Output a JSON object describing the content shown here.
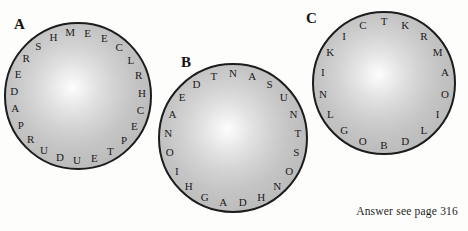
{
  "page": {
    "width": 468,
    "height": 231,
    "background": "#fdfdfc",
    "ink": "#1a1a1a"
  },
  "puzzles": [
    {
      "id": "a",
      "label": "A",
      "label_x": 14,
      "label_y": 17,
      "circle": {
        "cx": 78,
        "cy": 96,
        "r": 74
      },
      "letter_radius": 64,
      "start_angle": -97,
      "letters": [
        "M",
        "E",
        "E",
        "C",
        "L",
        "R",
        "H",
        "C",
        "E",
        "P",
        "T",
        "E",
        "U",
        "D",
        "U",
        "R",
        "P",
        "A",
        "D",
        "E",
        "R",
        "S",
        "H"
      ]
    },
    {
      "id": "b",
      "label": "B",
      "label_x": 181,
      "label_y": 55,
      "circle": {
        "cx": 233,
        "cy": 138,
        "r": 75
      },
      "letter_radius": 65,
      "start_angle": -90,
      "letters": [
        "N",
        "A",
        "S",
        "U",
        "N",
        "T",
        "S",
        "O",
        "N",
        "H",
        "D",
        "A",
        "G",
        "H",
        "I",
        "O",
        "N",
        "A",
        "E",
        "D",
        "T"
      ]
    },
    {
      "id": "c",
      "label": "C",
      "label_x": 306,
      "label_y": 11,
      "circle": {
        "cx": 384,
        "cy": 83,
        "r": 72
      },
      "letter_radius": 62,
      "start_angle": -90,
      "letters": [
        "T",
        "K",
        "R",
        "M",
        "A",
        "O",
        "I",
        "L",
        "D",
        "B",
        "O",
        "G",
        "L",
        "N",
        "I",
        "K",
        "I",
        "C"
      ]
    }
  ],
  "answer_note": "Answer see page 316"
}
